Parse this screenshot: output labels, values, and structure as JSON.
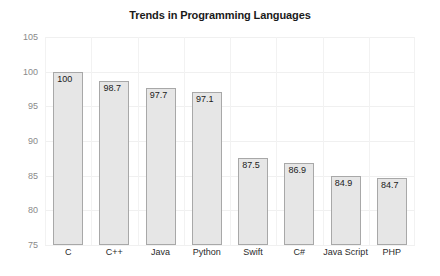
{
  "chart_data": {
    "type": "bar",
    "title": "Trends in Programming Languages",
    "xlabel": "",
    "ylabel": "",
    "categories": [
      "C",
      "C++",
      "Java",
      "Python",
      "Swift",
      "C#",
      "Java Script",
      "PHP"
    ],
    "values": [
      100,
      98.7,
      97.7,
      97.1,
      87.5,
      86.9,
      84.9,
      84.7
    ],
    "value_labels": [
      "100",
      "98.7",
      "97.7",
      "97.1",
      "87.5",
      "86.9",
      "84.9",
      "84.7"
    ],
    "ylim": [
      75,
      105
    ],
    "yticks": [
      75,
      80,
      85,
      90,
      95,
      100,
      105
    ],
    "ytick_labels": [
      "75",
      "80",
      "85",
      "90",
      "95",
      "100",
      "105"
    ],
    "grid": true,
    "legend": false,
    "legend_position": "none",
    "colors": {
      "bar_fill": "#e6e6e6",
      "bar_border": "#a8a8a8",
      "grid": "#f0f0f0",
      "title_text": "#1a1a1a",
      "ytick_text": "#8a8a8a",
      "xtick_text": "#2a2a2a",
      "background": "#ffffff"
    }
  }
}
